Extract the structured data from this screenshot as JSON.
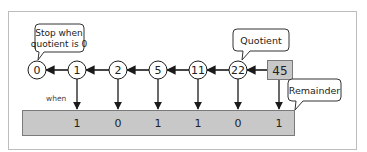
{
  "diagram": {
    "start_value": "45",
    "quotients": [
      "22",
      "11",
      "5",
      "2",
      "1",
      "0"
    ],
    "remainders": [
      "1",
      "0",
      "1",
      "1",
      "0",
      "1"
    ],
    "callouts": {
      "stop": "Stop when quotient is 0",
      "stop_line1": "Stop when",
      "stop_line2": "quotient is 0",
      "quotient": "Quotient",
      "remainder": "Remainder"
    },
    "when_label": "when",
    "colors": {
      "frame": "#bdbdbd",
      "box_fill": "#c8c8c8",
      "box_stroke": "#7a7a7a",
      "line": "#1a1a1a",
      "text": "#222222"
    }
  }
}
